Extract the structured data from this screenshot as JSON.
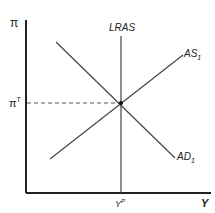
{
  "diagram": {
    "type": "AD-AS macroeconomic equilibrium",
    "y_axis": {
      "label": "π",
      "target_label_base": "π",
      "target_label_sup": "T"
    },
    "x_axis": {
      "label": "Y",
      "potential_label_base": "Y",
      "potential_label_sup": "P"
    },
    "curves": [
      {
        "name": "LRAS",
        "label": "LRAS",
        "type": "vertical"
      },
      {
        "name": "AS1",
        "label_base": "AS",
        "label_sub": "1",
        "slope": "upward"
      },
      {
        "name": "AD1",
        "label_base": "AD",
        "label_sub": "1",
        "slope": "downward"
      }
    ],
    "equilibrium": {
      "x_label": "Y^P",
      "y_label": "π^T",
      "dashed_guide": true
    },
    "colors": {
      "axis": "#222222",
      "curve": "#444444",
      "dash": "#555555"
    }
  }
}
